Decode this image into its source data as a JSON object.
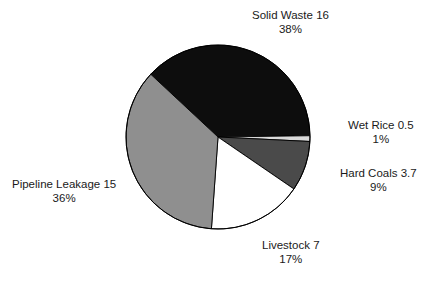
{
  "chart_data": {
    "type": "pie",
    "title": "",
    "subtitle": "",
    "xlabel": "",
    "ylabel": "",
    "legend_position": "none",
    "labels_position": "outside",
    "grid": false,
    "total": 42.2,
    "units": "",
    "categories": [
      "Solid Waste",
      "Wet Rice",
      "Hard Coals",
      "Livestock",
      "Pipeline Leakage"
    ],
    "values": [
      16,
      0.5,
      3.7,
      7,
      15
    ],
    "percents": [
      38,
      1,
      9,
      17,
      36
    ],
    "slices": [
      {
        "name": "Solid Waste",
        "value": 16,
        "value_text": "16",
        "percent": 38,
        "percent_text": "38%",
        "label_text": "Solid Waste 16",
        "color": "#0d0d0d",
        "start_angle": 223.0,
        "end_angle": 359.2
      },
      {
        "name": "Wet Rice",
        "value": 0.5,
        "value_text": "0.5",
        "percent": 1,
        "percent_text": "1%",
        "label_text": "Wet Rice 0.5",
        "color": "#d9d9d9",
        "start_angle": 359.2,
        "end_angle": 362.8
      },
      {
        "name": "Hard Coals",
        "value": 3.7,
        "value_text": "3.7",
        "percent": 9,
        "percent_text": "9%",
        "label_text": "Hard Coals 3.7",
        "color": "#4a4a4a",
        "start_angle": 362.8,
        "end_angle": 394.4
      },
      {
        "name": "Livestock",
        "value": 7,
        "value_text": "7",
        "percent": 17,
        "percent_text": "17%",
        "label_text": "Livestock 7",
        "color": "#ffffff",
        "start_angle": 394.4,
        "end_angle": 454.1
      },
      {
        "name": "Pipeline Leakage",
        "value": 15,
        "value_text": "15",
        "percent": 36,
        "percent_text": "36%",
        "label_text": "Pipeline Leakage 15",
        "color": "#8f8f8f",
        "start_angle": 454.1,
        "end_angle": 583.0
      }
    ],
    "geometry": {
      "center_x": 218,
      "center_y": 137,
      "radius": 92,
      "outline_color": "#000000"
    }
  },
  "labels": {
    "solid_waste": {
      "name": "Solid Waste 16",
      "percent": "38%"
    },
    "wet_rice": {
      "name": "Wet Rice 0.5",
      "percent": "1%"
    },
    "hard_coals": {
      "name": "Hard Coals 3.7",
      "percent": "9%"
    },
    "livestock": {
      "name": "Livestock 7",
      "percent": "17%"
    },
    "pipeline_leakage": {
      "name": "Pipeline Leakage 15",
      "percent": "36%"
    }
  },
  "artifacts": {
    "bottom_clipped_row": ""
  }
}
